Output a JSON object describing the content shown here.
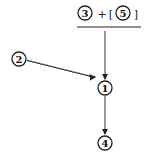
{
  "diagram": {
    "expression": {
      "left": "3",
      "operator": "+",
      "open_bracket": "[",
      "right": "5",
      "close_bracket": "]"
    },
    "nodes": [
      {
        "id": "n1",
        "label": "1"
      },
      {
        "id": "n2",
        "label": "2"
      },
      {
        "id": "n3",
        "label": "3"
      },
      {
        "id": "n4",
        "label": "4"
      },
      {
        "id": "n5",
        "label": "5"
      }
    ],
    "edges": [
      {
        "from": "expression",
        "to": "1",
        "style": "solid"
      },
      {
        "from": "2",
        "to": "1",
        "style": "wavy"
      },
      {
        "from": "1",
        "to": "4",
        "style": "solid"
      }
    ],
    "colors": {
      "stroke": "#222222",
      "background": "#ffffff"
    }
  }
}
